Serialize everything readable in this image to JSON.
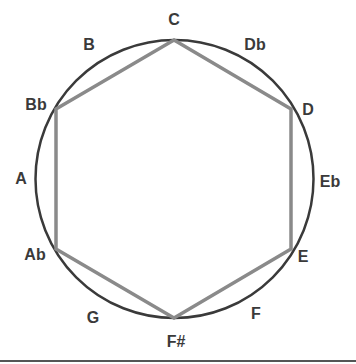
{
  "diagram": {
    "title": "",
    "circle": {
      "cx": 174.5,
      "cy": 179,
      "r": 139,
      "stroke": "#3a3a3a"
    },
    "hexagon": {
      "stroke": "#8a8a8a",
      "vertices": [
        "C",
        "D",
        "E",
        "F#",
        "Ab",
        "Bb"
      ]
    },
    "notes": [
      {
        "label": "C",
        "x": 174,
        "y": 20
      },
      {
        "label": "Db",
        "x": 255,
        "y": 45
      },
      {
        "label": "D",
        "x": 308,
        "y": 110
      },
      {
        "label": "Eb",
        "x": 330,
        "y": 182
      },
      {
        "label": "E",
        "x": 303,
        "y": 257
      },
      {
        "label": "F",
        "x": 256,
        "y": 314
      },
      {
        "label": "F#",
        "x": 176,
        "y": 342
      },
      {
        "label": "G",
        "x": 93,
        "y": 318
      },
      {
        "label": "Ab",
        "x": 35,
        "y": 255
      },
      {
        "label": "A",
        "x": 21,
        "y": 179
      },
      {
        "label": "Bb",
        "x": 36,
        "y": 105
      },
      {
        "label": "B",
        "x": 89,
        "y": 45
      }
    ]
  }
}
